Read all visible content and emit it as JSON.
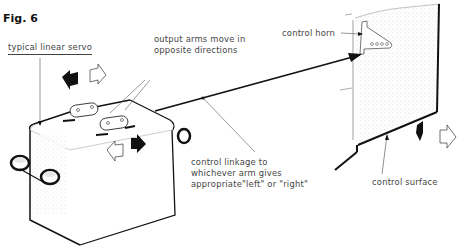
{
  "figure": {
    "title": "Fig. 6",
    "labels": {
      "servo": "typical linear servo",
      "arms_line1": "output arms move in",
      "arms_line2": "opposite directions",
      "horn": "control horn",
      "linkage_line1": "control linkage to",
      "linkage_line2": "whichever arm gives",
      "linkage_line3": "appropriate\"left\" or \"right\"",
      "surface": "control surface"
    }
  },
  "icons": {
    "servo_arrows_top": [
      "arrow-left-filled",
      "arrow-right-outline"
    ],
    "servo_arrows_mid": [
      "arrow-left-outline",
      "arrow-right-filled"
    ],
    "surface_arrows": [
      "arrow-left-filled",
      "arrow-right-outline"
    ]
  },
  "colors": {
    "ink": "#111111",
    "text": "#444444",
    "stipple": "#cccccc",
    "background": "#ffffff"
  }
}
